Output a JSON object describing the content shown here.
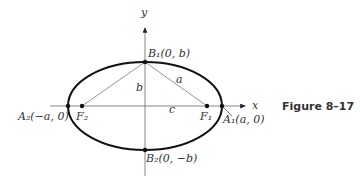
{
  "figure": {
    "caption": "Figure 8–17",
    "axes": {
      "x_label": "x",
      "y_label": "y"
    },
    "points": {
      "B1": "B₁(0, b)",
      "B2": "B₂(0, −b)",
      "A1": "A₁(a, 0)",
      "A2": "A₂(−a, 0)",
      "F1": "F₁",
      "F2": "F₂"
    },
    "segments": {
      "a": "a",
      "b": "b",
      "c": "c"
    }
  }
}
